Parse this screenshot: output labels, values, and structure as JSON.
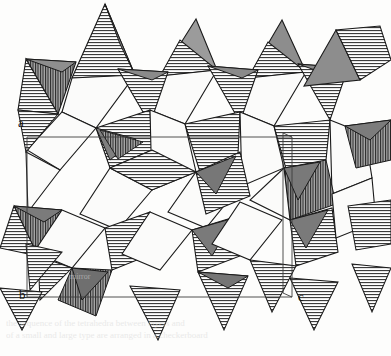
{
  "figure": {
    "kind": "crystal-structure-polyhedral-diagram",
    "background_color": "#fdfdfc",
    "outline_color": "#1a1a1a",
    "cell_line_color": "#3c3c3c"
  },
  "axis_labels": [
    {
      "id": "a",
      "text": "a",
      "x": 18,
      "y": 116
    },
    {
      "id": "b",
      "text": "b",
      "x": 19,
      "y": 288
    },
    {
      "id": "c",
      "text": "c",
      "x": 298,
      "y": 290
    }
  ],
  "unit_cell": {
    "stroke": "#3c3c3c",
    "stroke_width": 0.9,
    "origin_label": "a",
    "front_face": [
      [
        27,
        137
      ],
      [
        292,
        137
      ],
      [
        292,
        297
      ],
      [
        27,
        297
      ]
    ],
    "back_face": [
      [
        27,
        137
      ],
      [
        288,
        131
      ],
      [
        288,
        291
      ],
      [
        27,
        297
      ]
    ],
    "edges": [
      [
        [
          27,
          137
        ],
        [
          292,
          137
        ]
      ],
      [
        [
          292,
          137
        ],
        [
          292,
          297
        ]
      ],
      [
        [
          292,
          297
        ],
        [
          27,
          297
        ]
      ],
      [
        [
          27,
          297
        ],
        [
          27,
          137
        ]
      ],
      [
        [
          283,
          133
        ],
        [
          283,
          293
        ]
      ],
      [
        [
          283,
          133
        ],
        [
          292,
          137
        ]
      ],
      [
        [
          283,
          293
        ],
        [
          292,
          297
        ]
      ]
    ]
  },
  "fills": {
    "face_white": "#fbfbfa",
    "face_hatch_h": "#5a5a5a",
    "face_hatch_v": "#4a4a4a",
    "face_dark": "#7d7d7d",
    "face_mid": "#9a9a9a"
  },
  "hatch_patterns": {
    "horizontal": {
      "name": "horizontal-line-hatch",
      "spacing": 3,
      "stroke_width": 1.0,
      "color": "#2b2b2b"
    },
    "vertical": {
      "name": "vertical-line-hatch",
      "spacing": 2.4,
      "stroke_width": 1.0,
      "color": "#2b2b2b"
    }
  },
  "lattice": {
    "columns": 4,
    "rows": 3,
    "dx": 88.5,
    "dy": 80,
    "row_shear_x": 44,
    "origin_x": -18,
    "origin_y": 14
  },
  "ghost_text_artifacts": [
    {
      "text": "the sequence of the tetrahedra between layers and",
      "x": 6,
      "y": 322,
      "size": 9
    },
    {
      "text": "of a small and large type are arranged in a checkerboard",
      "x": 6,
      "y": 334,
      "size": 9
    },
    {
      "text": "mirror",
      "x": 70,
      "y": 276,
      "size": 8
    }
  ],
  "legend": {
    "white_face": "upward-pointing tetrahedron face",
    "hatched_face": "side face (horizontal hatch)",
    "dark_face": "downward-pointing tetrahedron face"
  }
}
